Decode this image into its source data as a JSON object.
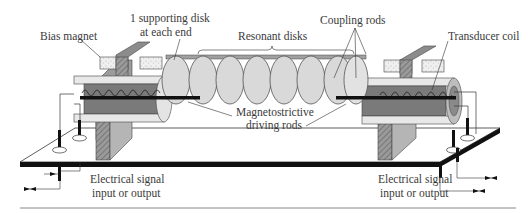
{
  "diagram": {
    "type": "mechanical-filter-schematic",
    "labels": {
      "bias_magnet": "Bias magnet",
      "supporting_disk_line1": "1 supporting disk",
      "supporting_disk_line2": "at each end",
      "resonant_disks": "Resonant disks",
      "coupling_rods": "Coupling rods",
      "transducer_coil": "Transducer coil",
      "magnetostrictive_line1": "Magnetostrictive",
      "magnetostrictive_line2": "driving rods",
      "signal_left_line1": "Electrical signal",
      "signal_left_line2": "input or output",
      "signal_right_line1": "Electrical signal",
      "signal_right_line2": "input or output"
    },
    "components": {
      "resonant_disk_count": 8,
      "supporting_disk_count": 2,
      "coupling_rod_count": 2,
      "transducer_count": 2,
      "bias_magnet_count": 2
    },
    "colors": {
      "disk_fill": "#d9d9d9",
      "disk_stroke": "#555555",
      "housing_dark": "#7a7a7a",
      "housing_mid": "#a6a6a6",
      "housing_light": "#e6e6e6",
      "magnet_fill": "#eeeeee",
      "rod_black": "#111111",
      "base_black": "#111111",
      "line": "#333333"
    }
  }
}
